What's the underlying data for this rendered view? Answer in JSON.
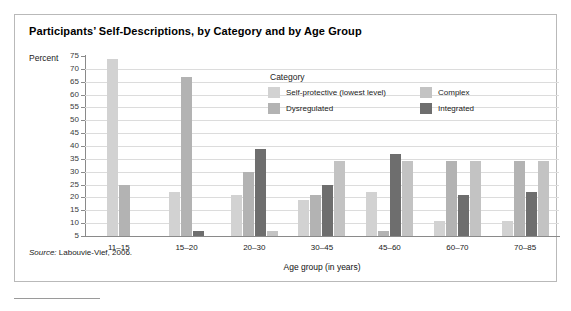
{
  "title": "Participants’ Self-Descriptions, by Category and by Age Group",
  "y_axis_label": "Percent",
  "x_axis_label": "Age group (in years)",
  "legend_title": "Category",
  "source_prefix": "Source:",
  "source_text": "Labouvie-Vief, 2006.",
  "colors": {
    "self_protective": "#d2d2d2",
    "dysregulated": "#b3b3b3",
    "complex": "#c3c3c3",
    "integrated": "#6e6e6e",
    "grid": "#dcdcdc",
    "axis": "#8a8a8a",
    "frame": "#b9b9b9"
  },
  "chart_data": {
    "type": "bar",
    "title": "Participants’ Self-Descriptions, by Category and by Age Group",
    "xlabel": "Age group (in years)",
    "ylabel": "Percent",
    "ylim": [
      5,
      75
    ],
    "yticks": [
      75,
      70,
      65,
      60,
      55,
      50,
      45,
      40,
      35,
      30,
      25,
      20,
      15,
      10,
      5
    ],
    "grid": true,
    "legend_position": "inside-top-center",
    "categories": [
      "11–15",
      "15–20",
      "20–30",
      "30–45",
      "45–60",
      "60–70",
      "70–85"
    ],
    "series": [
      {
        "name": "Self-protective (lowest level)",
        "color": "#d2d2d2",
        "values": [
          74,
          22,
          21,
          19,
          22,
          11,
          11
        ]
      },
      {
        "name": "Dysregulated",
        "color": "#b3b3b3",
        "values": [
          25,
          67,
          30,
          21,
          7,
          34,
          34
        ]
      },
      {
        "name": "Integrated",
        "color": "#6e6e6e",
        "values": [
          0,
          7,
          39,
          25,
          37,
          21,
          22
        ]
      },
      {
        "name": "Complex",
        "color": "#c3c3c3",
        "values": [
          0,
          0,
          7,
          34,
          34,
          34,
          34
        ]
      }
    ]
  }
}
